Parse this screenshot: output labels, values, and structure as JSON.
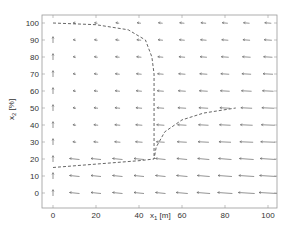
{
  "chart_data": {
    "type": "quiver",
    "title": "",
    "xlabel": "x_1 [m]",
    "ylabel": "x_2 [%]",
    "xlim": [
      -5,
      105
    ],
    "ylim": [
      -5,
      105
    ],
    "xticks": [
      0,
      20,
      40,
      60,
      80,
      100
    ],
    "yticks": [
      0,
      10,
      20,
      30,
      40,
      50,
      60,
      70,
      80,
      90,
      100
    ],
    "grid": false,
    "legend": null,
    "vector_field": {
      "description": "Arrow field on 10x10 grid; arrows point left (negative x1), length grows with x1 and shrinks with x2; at x1=0 arrows point up",
      "grid_x": [
        0,
        10,
        20,
        30,
        40,
        50,
        60,
        70,
        80,
        90,
        100
      ],
      "grid_y": [
        0,
        10,
        20,
        30,
        40,
        50,
        60,
        70,
        80,
        90,
        100
      ]
    },
    "series": [
      {
        "name": "trajectory-upper",
        "style": "dashed",
        "points": [
          [
            0,
            100
          ],
          [
            20,
            99
          ],
          [
            35,
            96
          ],
          [
            43,
            90
          ],
          [
            46,
            80
          ],
          [
            47,
            70
          ],
          [
            47,
            50
          ],
          [
            47,
            35
          ],
          [
            47,
            20
          ]
        ]
      },
      {
        "name": "trajectory-lower",
        "style": "dashed",
        "points": [
          [
            0,
            15
          ],
          [
            20,
            17
          ],
          [
            40,
            19
          ],
          [
            47,
            20
          ],
          [
            48,
            27
          ],
          [
            52,
            36
          ],
          [
            60,
            43
          ],
          [
            70,
            47
          ],
          [
            85,
            50
          ]
        ]
      }
    ]
  }
}
